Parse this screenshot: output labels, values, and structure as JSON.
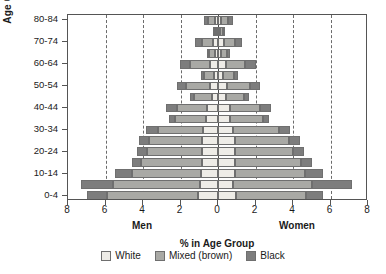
{
  "chart_data": {
    "type": "bar",
    "subtype": "population-pyramid",
    "title": "",
    "xlabel": "% in Age Group",
    "ylabel": "Age Group",
    "left_group_label": "Men",
    "right_group_label": "Women",
    "xlim": [
      -8,
      8
    ],
    "xticks": [
      -8,
      -6,
      -4,
      -2,
      0,
      2,
      4,
      6,
      8
    ],
    "xtick_labels": [
      "8",
      "6",
      "4",
      "2",
      "0",
      "2",
      "4",
      "6",
      "8"
    ],
    "gridlines_x": [
      -6,
      -4,
      -2,
      2,
      4,
      6
    ],
    "grid": true,
    "legend_position": "bottom",
    "legend": [
      {
        "label": "White",
        "color": "#eeece7"
      },
      {
        "label": "Mixed (brown)",
        "color": "#a9a9a5"
      },
      {
        "label": "Black",
        "color": "#7d7d7d"
      }
    ],
    "categories": [
      "0-4",
      "5-9",
      "10-14",
      "15-19",
      "20-24",
      "25-29",
      "30-34",
      "35-39",
      "40-44",
      "45-49",
      "50-54",
      "55-59",
      "60-64",
      "65-69",
      "70-74",
      "75-79",
      "80-84"
    ],
    "ytick_labels": [
      "0-4",
      "10-14",
      "20-24",
      "30-34",
      "40-44",
      "50-54",
      "60-64",
      "70-74",
      "80-84"
    ],
    "men": {
      "white": [
        1.05,
        0.96,
        0.9,
        0.88,
        0.88,
        0.88,
        0.8,
        0.62,
        0.58,
        0.34,
        0.45,
        0.22,
        0.42,
        0.18,
        0.28,
        0.1,
        0.16
      ],
      "mixed": [
        4.85,
        4.64,
        3.7,
        3.22,
        2.92,
        2.82,
        2.4,
        1.68,
        1.62,
        0.92,
        1.25,
        0.55,
        1.05,
        0.3,
        0.6,
        0.12,
        0.35
      ],
      "black": [
        1.1,
        1.7,
        0.9,
        0.5,
        0.5,
        0.5,
        0.62,
        0.3,
        0.55,
        0.22,
        0.5,
        0.15,
        0.55,
        0.1,
        0.35,
        0.05,
        0.22
      ]
    },
    "women": {
      "white": [
        0.95,
        0.8,
        0.88,
        0.9,
        0.92,
        0.88,
        0.82,
        0.62,
        0.62,
        0.4,
        0.48,
        0.26,
        0.44,
        0.18,
        0.3,
        0.12,
        0.18
      ],
      "mixed": [
        3.75,
        4.2,
        3.75,
        3.5,
        3.1,
        2.92,
        2.42,
        1.8,
        1.62,
        1.0,
        1.25,
        0.6,
        1.02,
        0.32,
        0.62,
        0.14,
        0.36
      ],
      "black": [
        0.9,
        2.15,
        0.95,
        0.6,
        0.58,
        0.55,
        0.62,
        0.32,
        0.58,
        0.26,
        0.52,
        0.18,
        0.56,
        0.12,
        0.38,
        0.06,
        0.24
      ]
    }
  }
}
